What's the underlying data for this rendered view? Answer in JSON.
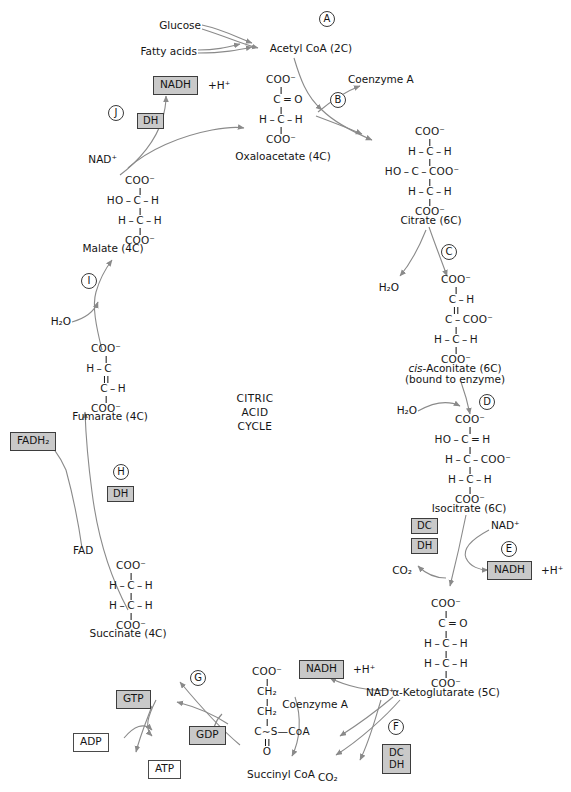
{
  "diagram": {
    "title": "CITRIC ACID CYCLE",
    "center_title_lines": [
      "CITRIC",
      "ACID",
      "CYCLE"
    ],
    "colors": {
      "filled_box_fill": "#c9c9c9",
      "box_border": "#4a4a4a",
      "arrow_stroke": "#8a8a8a",
      "text": "#141414",
      "background": "#ffffff"
    }
  },
  "inputs": {
    "glucose": "Glucose",
    "fatty_acids": "Fatty acids"
  },
  "steps": [
    {
      "id": "A",
      "label": "A"
    },
    {
      "id": "B",
      "label": "B"
    },
    {
      "id": "C",
      "label": "C"
    },
    {
      "id": "D",
      "label": "D"
    },
    {
      "id": "E",
      "label": "E"
    },
    {
      "id": "F",
      "label": "F"
    },
    {
      "id": "G",
      "label": "G"
    },
    {
      "id": "H",
      "label": "H"
    },
    {
      "id": "I",
      "label": "I"
    },
    {
      "id": "J",
      "label": "J"
    }
  ],
  "metabolites": {
    "acetyl_coa": {
      "name": "Acetyl CoA (2C)"
    },
    "oxaloacetate": {
      "name": "Oxaloacetate (4C)",
      "formula_rows": [
        "COO⁻",
        "C = O",
        "H – C – H",
        "COO⁻"
      ]
    },
    "citrate": {
      "name": "Citrate (6C)",
      "formula_rows": [
        "COO⁻",
        "H – C – H",
        "HO – C – COO⁻",
        "H – C – H",
        "COO⁻"
      ]
    },
    "cis_aconitate": {
      "name": "cis-Aconitate (6C)",
      "name_italic_prefix": "cis",
      "name_rest": "-Aconitate (6C)",
      "note": "(bound to enzyme)",
      "formula_rows": [
        "COO⁻",
        "C – H",
        "C – COO⁻",
        "H – C – H",
        "COO⁻"
      ]
    },
    "isocitrate": {
      "name": "Isocitrate (6C)",
      "formula_rows": [
        "COO⁻",
        "HO – C = H",
        "H – C – COO⁻",
        "H – C – H",
        "COO⁻"
      ]
    },
    "alpha_ketoglutarate": {
      "name": "α-Ketoglutarate (5C)",
      "formula_rows": [
        "COO⁻",
        "C = O",
        "H – C – H",
        "H – C – H",
        "COO⁻"
      ]
    },
    "succinyl_coa": {
      "name": "Succinyl CoA",
      "formula_rows": [
        "COO⁻",
        "CH₂",
        "CH₂",
        "C∼S—CoA",
        "O"
      ]
    },
    "succinate": {
      "name": "Succinate (4C)",
      "formula_rows": [
        "COO⁻",
        "H – C – H",
        "H – C – H",
        "COO⁻"
      ]
    },
    "fumarate": {
      "name": "Fumarate (4C)",
      "formula_rows": [
        "COO⁻",
        "H – C",
        "C – H",
        "COO⁻"
      ]
    },
    "malate": {
      "name": "Malate (4C)",
      "formula_rows": [
        "COO⁻",
        "HO – C – H",
        "H – C – H",
        "COO⁻"
      ]
    }
  },
  "cofactors": {
    "nadh_j": {
      "label": "NADH",
      "plus_h": "+H⁺"
    },
    "nadh_e": {
      "label": "NADH",
      "plus_h": "+H⁺"
    },
    "nadh_f": {
      "label": "NADH",
      "plus_h": "+H⁺"
    },
    "nad_j": "NAD⁺",
    "nad_e": "NAD⁺",
    "nad_f": "NAD⁺",
    "fad": "FAD",
    "fadh2": "FADH₂",
    "coenzyme_a_b": "Coenzyme A",
    "coenzyme_a_f": "Coenzyme A",
    "water_c": "H₂O",
    "water_d": "H₂O",
    "water_i": "H₂O",
    "co2_e": "CO₂",
    "co2_f": "CO₂"
  },
  "enzyme_tags": {
    "dh_j": "DH",
    "dh_h": "DH",
    "dc_e": "DC",
    "dh_e": "DH",
    "dc_f": "DC",
    "dh_f": "DH"
  },
  "nucleotides": {
    "gtp": "GTP",
    "gdp": "GDP",
    "adp": "ADP",
    "atp": "ATP"
  }
}
